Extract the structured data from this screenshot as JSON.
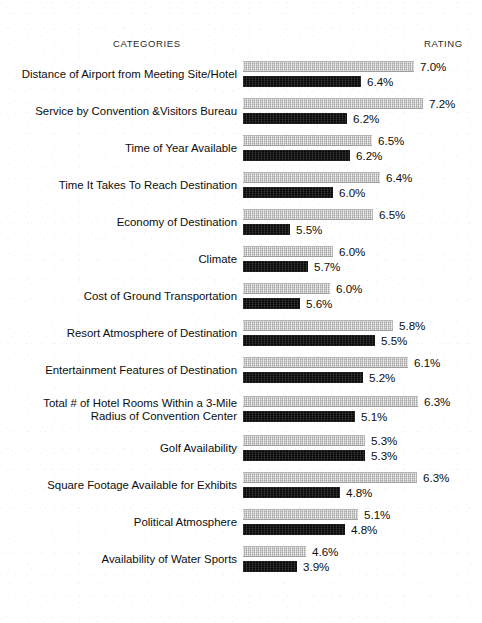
{
  "header": {
    "categories_label": "CATEGORIES",
    "rating_label": "RATING"
  },
  "colors": {
    "gray_series": "#c6c6c6",
    "black_series": "#0a0a0a",
    "page_background": "#ffffff",
    "text": "#0d0d0d"
  },
  "chart_data": {
    "type": "bar",
    "orientation": "horizontal",
    "title": "",
    "subtitle": "",
    "xlabel": "RATING",
    "ylabel": "CATEGORIES",
    "grid": false,
    "legend_position": "none",
    "value_suffix": "%",
    "axis_note": "Bar lengths drawn on a suppressed-zero scale; pixel widths captured per bar.",
    "categories": [
      "Distance of Airport from Meeting Site/Hotel",
      "Service by Convention &Visitors Bureau",
      "Time of Year Available",
      "Time It Takes To Reach Destination",
      "Economy of Destination",
      "Climate",
      "Cost of Ground Transportation",
      "Resort Atmosphere of Destination",
      "Entertainment Features of Destination",
      "Total # of Hotel Rooms Within a 3-Mile\nRadius of Convention Center",
      "Golf Availability",
      "Square Footage Available for Exhibits",
      "Political Atmosphere",
      "Availability of Water Sports"
    ],
    "series": [
      {
        "name": "gray",
        "values": [
          7.0,
          7.2,
          6.5,
          6.4,
          6.5,
          6.0,
          6.0,
          5.8,
          6.1,
          6.3,
          5.3,
          6.3,
          5.1,
          4.6
        ],
        "labels": [
          "7.0%",
          "7.2%",
          "6.5%",
          "6.4%",
          "6.5%",
          "6.0%",
          "6.0%",
          "5.8%",
          "6.1%",
          "6.3%",
          "5.3%",
          "6.3%",
          "5.1%",
          "4.6%"
        ],
        "bar_px": [
          171,
          180,
          129,
          137,
          130,
          90,
          87,
          150,
          165,
          175,
          122,
          174,
          115,
          63
        ]
      },
      {
        "name": "black",
        "values": [
          6.4,
          6.2,
          6.2,
          6.0,
          5.5,
          5.7,
          5.6,
          5.5,
          5.2,
          5.1,
          5.3,
          4.8,
          4.8,
          3.9
        ],
        "labels": [
          "6.4%",
          "6.2%",
          "6.2%",
          "6.0%",
          "5.5%",
          "5.7%",
          "5.6%",
          "5.5%",
          "5.2%",
          "5.1%",
          "5.3%",
          "4.8%",
          "4.8%",
          "3.9%"
        ],
        "bar_px": [
          118,
          104,
          107,
          90,
          47,
          65,
          57,
          132,
          120,
          112,
          122,
          97,
          102,
          54
        ]
      }
    ]
  }
}
